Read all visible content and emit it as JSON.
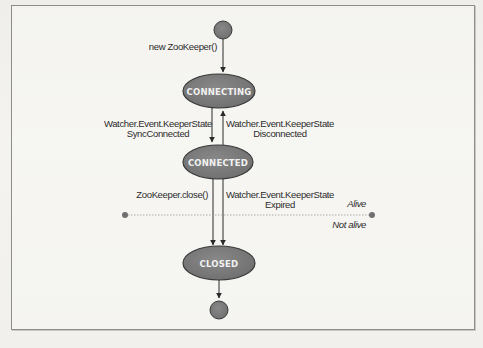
{
  "figure": {
    "type": "state-diagram",
    "colors": {
      "state_fill": "#7d7d7d",
      "state_stroke": "#3a3a3a",
      "state_text": "#f2f2f2",
      "arrow": "#2a2a2a",
      "label_text": "#2b2b2b",
      "box_border": "#8d8d8d",
      "divider": "#9a9a9a"
    },
    "nodes": [
      {
        "id": "start",
        "kind": "initial",
        "label": ""
      },
      {
        "id": "connecting",
        "kind": "state",
        "label": "CONNECTING"
      },
      {
        "id": "connected",
        "kind": "state",
        "label": "CONNECTED"
      },
      {
        "id": "closed",
        "kind": "state",
        "label": "CLOSED"
      },
      {
        "id": "end",
        "kind": "final",
        "label": ""
      }
    ],
    "edges": [
      {
        "from": "start",
        "to": "connecting",
        "label": "new ZooKeeper()"
      },
      {
        "from": "connecting",
        "to": "connected",
        "label_line1": "Watcher.Event.KeeperState",
        "label_line2": "SyncConnected"
      },
      {
        "from": "connected",
        "to": "connecting",
        "label_line1": "Watcher.Event.KeeperState",
        "label_line2": "Disconnected"
      },
      {
        "from": "connected",
        "to": "closed",
        "label": "ZooKeeper.close()"
      },
      {
        "from": "connected",
        "to": "closed",
        "label_line1": "Watcher.Event.KeeperState",
        "label_line2": "Expired"
      },
      {
        "from": "closed",
        "to": "end",
        "label": ""
      }
    ],
    "divider": {
      "above_label": "Alive",
      "below_label": "Not alive"
    }
  }
}
